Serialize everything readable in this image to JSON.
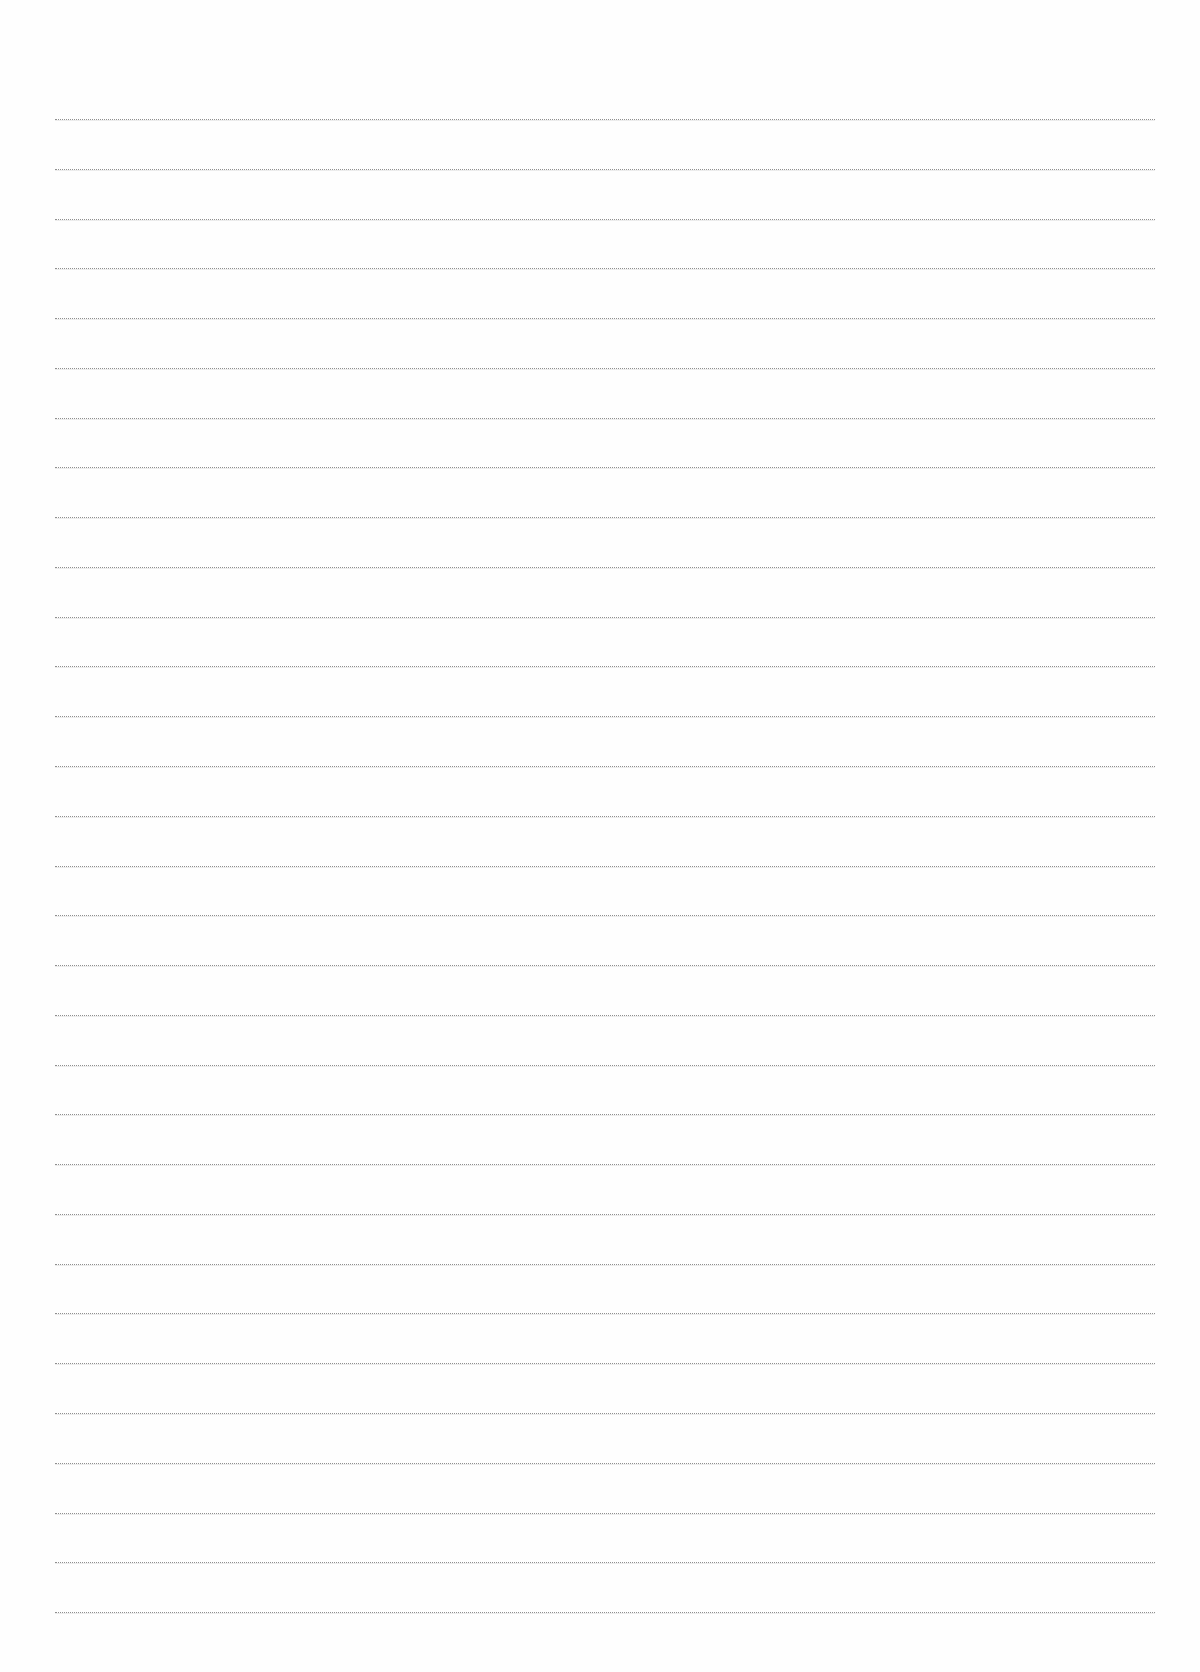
{
  "page": {
    "type": "lined-paper",
    "background_color": "#fefefe",
    "line_color": "#8f8f8f",
    "line_count": 31,
    "first_line_y": 119,
    "line_spacing": 49.77,
    "line_left_x": 55,
    "line_right_x": 1155
  }
}
